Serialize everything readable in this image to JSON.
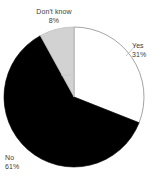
{
  "chart_data": {
    "type": "pie",
    "title": "",
    "subtitle": "",
    "xlabel": "",
    "ylabel": "",
    "grid": false,
    "legend_position": "none",
    "label_mode": "outside-callout",
    "start_angle_deg": 0,
    "direction": "clockwise",
    "categories": [
      "Yes",
      "No",
      "Don't know"
    ],
    "values": [
      31,
      61,
      8
    ],
    "value_unit": "%",
    "slices": [
      {
        "name": "Yes",
        "value": 31,
        "label": "Yes",
        "pct_label": "31%",
        "color": "#ffffff",
        "stroke": "#8c8c8c"
      },
      {
        "name": "No",
        "value": 61,
        "label": "No",
        "pct_label": "61%",
        "color": "#000000",
        "stroke": "#000000"
      },
      {
        "name": "Don't know",
        "value": 8,
        "label": "Don't know",
        "pct_label": "8%",
        "color": "#d2d2d2",
        "stroke": "#b4b4b4"
      }
    ],
    "colors": {
      "yes": "#ffffff",
      "no": "#000000",
      "dont_know": "#d2d2d2",
      "outline": "#8c8c8c",
      "text": "#3c3c3c",
      "background": "#ffffff"
    },
    "geometry": {
      "center_x": 74,
      "center_y": 97,
      "radius": 70
    }
  }
}
